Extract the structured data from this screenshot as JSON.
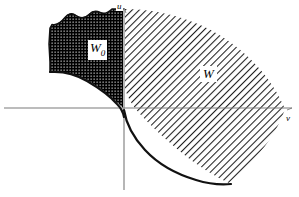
{
  "figure": {
    "width": 299,
    "height": 197,
    "background_color": "#ffffff",
    "line_color": "#000000"
  },
  "axes": {
    "vertical": {
      "label": "u",
      "x": 124,
      "y_top": 8,
      "y_bottom": 190,
      "color": "#808080"
    },
    "horizontal": {
      "label": "v",
      "y": 108,
      "x_left": 4,
      "x_right": 292,
      "color": "#808080"
    },
    "origin": {
      "x": 124,
      "y": 108
    }
  },
  "regions": [
    {
      "name": "W0",
      "label": "W",
      "label_subscript": "0",
      "fill": "stipple-dark",
      "description": "dark stippled region left of the u-axis above the boundary curve",
      "label_position": {
        "x": 88,
        "y": 40
      }
    },
    {
      "name": "W",
      "label": "W",
      "label_subscript": "",
      "fill": "diagonal-hatch",
      "description": "diagonally hatched region right of the u-axis bounded by an outer arc and a descending curve",
      "label_position": {
        "x": 200,
        "y": 66
      }
    }
  ],
  "curves": [
    {
      "name": "w0-boundary",
      "description": "wavy upper-left outline and descending lower boundary of W0 meeting the u-axis near the origin"
    },
    {
      "name": "w-lower-boundary",
      "description": "curve descending from the origin to the lower right, forming the lower edge of W"
    },
    {
      "name": "w-outer-arc",
      "description": "arc sweeping from the top of the u-axis rightwards and down past the v-axis"
    }
  ],
  "colors": {
    "stroke": "#000000",
    "axis": "#7a7a7a",
    "hatch": "#2b2b2b",
    "stipple": "#000000",
    "background": "#ffffff"
  }
}
